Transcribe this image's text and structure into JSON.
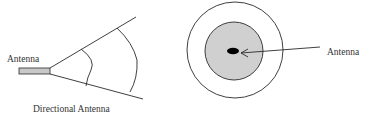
{
  "diagram": {
    "directional": {
      "antenna_label": "Antenna",
      "caption": "Directional Antenna",
      "antenna_fill": "#c8c8c8",
      "stroke_color": "#2a2a2a"
    },
    "omnidirectional": {
      "antenna_label": "Antenna",
      "outer_circle_fill": "#ffffff",
      "inner_circle_fill": "#d0d0d0",
      "antenna_dot_color": "#000000",
      "stroke_color": "#2a2a2a"
    }
  }
}
